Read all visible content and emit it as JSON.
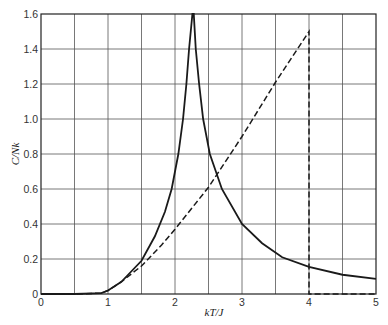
{
  "chart_data": {
    "type": "line",
    "title": "",
    "xlabel": "kT/J",
    "ylabel": "C/Nk",
    "xlim": [
      0,
      5
    ],
    "ylim": [
      0,
      1.6
    ],
    "grid": true,
    "x_grid_step": 0.5,
    "y_grid_step": 0.2,
    "xticks": [
      0,
      1,
      2,
      3,
      4,
      5
    ],
    "xtick_labels": [
      "0",
      "1",
      "2",
      "3",
      "4",
      "5"
    ],
    "yticks": [
      0,
      0.2,
      0.4,
      0.6,
      0.8,
      1.0,
      1.2,
      1.4,
      1.6
    ],
    "ytick_labels": [
      "0",
      "0.2",
      "0.4",
      "0.6",
      "0.8",
      "1.0",
      "1.2",
      "1.4",
      "1.6"
    ],
    "legend": null,
    "series": [
      {
        "name": "exact (Onsager) solution",
        "style": "solid",
        "x": [
          0,
          0.5,
          0.9,
          1.0,
          1.2,
          1.4,
          1.5,
          1.7,
          1.85,
          1.95,
          2.05,
          2.12,
          2.17,
          2.21,
          2.24,
          2.26,
          2.269,
          2.28,
          2.31,
          2.36,
          2.42,
          2.52,
          2.7,
          3.0,
          3.3,
          3.6,
          4.0,
          4.5,
          5.0
        ],
        "y": [
          0,
          0,
          0.005,
          0.02,
          0.07,
          0.15,
          0.19,
          0.33,
          0.47,
          0.6,
          0.8,
          1.0,
          1.2,
          1.4,
          1.52,
          1.6,
          1.6,
          1.6,
          1.4,
          1.2,
          1.0,
          0.8,
          0.6,
          0.4,
          0.29,
          0.21,
          0.155,
          0.11,
          0.086
        ]
      },
      {
        "name": "mean-field approximation",
        "style": "dashed",
        "x": [
          0,
          0.5,
          0.9,
          1.0,
          1.2,
          1.5,
          1.8,
          2.0,
          2.5,
          3.0,
          3.5,
          4.0,
          4.0,
          5.0
        ],
        "y": [
          0,
          0,
          0.005,
          0.02,
          0.07,
          0.16,
          0.28,
          0.37,
          0.61,
          0.9,
          1.21,
          1.5,
          0,
          0
        ]
      }
    ]
  },
  "plot": {
    "x_axis_label": "kT/J",
    "y_axis_label": "C/Nk"
  }
}
